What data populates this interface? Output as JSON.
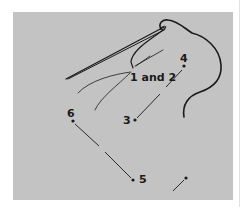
{
  "diagram": {
    "background_color": "#c3c3c3",
    "ink_color": "#1a1a1a",
    "labels": {
      "start": "1 and 2",
      "p3": "3",
      "p4": "4",
      "p5": "5",
      "p6": "6"
    },
    "points": [
      {
        "id": "1 and 2",
        "x": 131,
        "y": 72
      },
      {
        "id": "3",
        "x": 135,
        "y": 120
      },
      {
        "id": "4",
        "x": 184,
        "y": 66
      },
      {
        "id": "5",
        "x": 133,
        "y": 180
      },
      {
        "id": "6",
        "x": 73,
        "y": 121
      },
      {
        "id": "next",
        "x": 186,
        "y": 178
      }
    ],
    "icons": [
      "needle-icon",
      "thread-icon"
    ]
  }
}
